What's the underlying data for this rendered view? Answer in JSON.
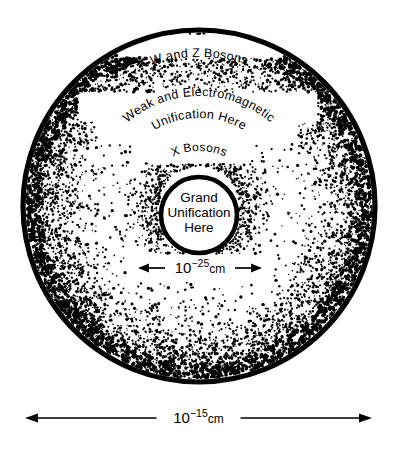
{
  "figure": {
    "background_color": "#ffffff",
    "ink_color": "#000000",
    "width": 397,
    "height": 452
  },
  "geometry": {
    "outer_circle": {
      "cx": 199,
      "cy": 206,
      "r": 176
    },
    "inner_circle": {
      "cx": 199,
      "cy": 215,
      "r": 38
    }
  },
  "labels": {
    "outer_ring": "W and Z Bosons",
    "middle_ring_line1": "Weak and Electromagnetic",
    "middle_ring_line2": "Unification Here",
    "x_bosons": "X Bosons",
    "core_line1": "Grand",
    "core_line2": "Unification",
    "core_line3": "Here"
  },
  "measurements": {
    "inner": {
      "base": "10",
      "exponent": "−25",
      "unit": "cm",
      "full": "10⁻²⁵ cm",
      "arrow_left_x": 138,
      "arrow_right_x": 262,
      "y": 268
    },
    "outer": {
      "base": "10",
      "exponent": "−15",
      "unit": "cm",
      "full": "10⁻¹⁵ cm",
      "arrow_left_x": 25,
      "arrow_right_x": 372,
      "y": 418
    }
  },
  "chart_data": {
    "type": "diagram",
    "regions": [
      {
        "name": "outer-annulus",
        "label": "W and Z Bosons",
        "radius_fraction": 0.92,
        "note": "outermost band of the large disc"
      },
      {
        "name": "middle-annulus",
        "label": "Weak and Electromagnetic Unification Here",
        "radius_fraction": 0.64,
        "note": "two-line curved label"
      },
      {
        "name": "inner-annulus",
        "label": "X Bosons",
        "radius_fraction": 0.34,
        "note": "just outside the core"
      },
      {
        "name": "core",
        "label": "Grand Unification Here",
        "radius_fraction": 0.22,
        "note": "central white disc with thick black ring"
      }
    ],
    "scales": [
      {
        "name": "core-diameter",
        "value": "10^-25 cm",
        "applies_to": "core"
      },
      {
        "name": "disc-diameter",
        "value": "10^-15 cm",
        "applies_to": "outer-annulus"
      }
    ],
    "stipple": {
      "pattern": "random dot density, highest at outer rim and around the core, lowest in mid annulus",
      "dot_color": "#000000"
    }
  }
}
